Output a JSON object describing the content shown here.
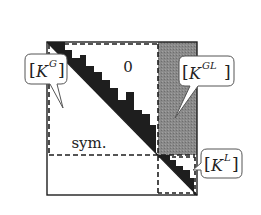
{
  "diagram": {
    "type": "block-matrix-sparsity",
    "regions": {
      "upper_label": "0",
      "lower_label": "sym."
    },
    "callouts": {
      "global": {
        "base": "K",
        "sup": "G"
      },
      "global_local": {
        "base": "K",
        "sup": "GL"
      },
      "local": {
        "base": "K",
        "sup": "L"
      }
    },
    "colors": {
      "border": "#222222",
      "skyline": "#222222",
      "coupling_block": "#8a8a8a",
      "background": "#ffffff"
    }
  }
}
